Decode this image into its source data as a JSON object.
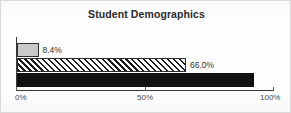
{
  "chart_data": {
    "type": "bar",
    "orientation": "horizontal",
    "title": "Student Demographics",
    "xlabel": "",
    "ylabel": "",
    "xlim": [
      0,
      100
    ],
    "grid": false,
    "legend": "none",
    "tick_labels": [
      "0%",
      "50%",
      "100%"
    ],
    "tick_values": [
      0,
      50,
      100
    ],
    "categories": [
      "",
      "",
      ""
    ],
    "values": [
      8.4,
      66.0,
      92.6
    ],
    "data_labels": [
      "8.4%",
      "66.0%",
      "92.6%"
    ],
    "bars": [
      {
        "value": 8.4,
        "label": "8.4%",
        "style": "solid-gray",
        "label_position": "outside"
      },
      {
        "value": 66.0,
        "label": "66.0%",
        "style": "hatch",
        "label_position": "outside"
      },
      {
        "value": 92.6,
        "label": "92.6%",
        "style": "solid-black",
        "label_position": "inside"
      }
    ]
  },
  "colors": {
    "bar_gray": "#c9c9c9",
    "bar_black": "#111111",
    "hatch_line": "#1c1c1c",
    "axis": "#3a3a3a",
    "text": "#2f2f2f",
    "title": "#2b2b2b",
    "frame": "#d9d9d9",
    "background": "#fdfdfd"
  }
}
